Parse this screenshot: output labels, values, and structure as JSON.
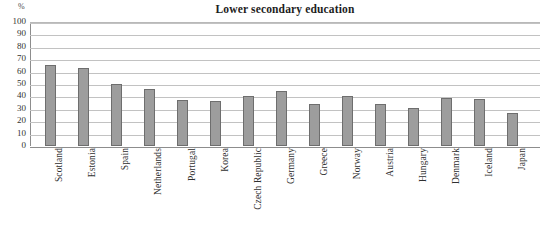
{
  "chart_data": {
    "type": "bar",
    "title": "Lower secondary education",
    "xlabel": "",
    "ylabel": "%",
    "unit": "%",
    "ylim": [
      0,
      100
    ],
    "ytick_step": 10,
    "yticks": [
      100,
      90,
      80,
      70,
      60,
      50,
      40,
      30,
      20,
      10,
      0
    ],
    "grid": true,
    "legend": "none",
    "bar_color": "#9d9d9d",
    "bar_border_color": "#6e6e6e",
    "gridline_color": "#c2c2c2",
    "axis_color": "#8d8d8d",
    "categories": [
      "Scotland",
      "Estonia",
      "Spain",
      "Netherlands",
      "Portugal",
      "Korea",
      "Czech Republic",
      "Germany",
      "Greece",
      "Norway",
      "Austria",
      "Hungary",
      "Denmark",
      "Iceland",
      "Japan"
    ],
    "values": [
      65,
      63,
      50,
      46,
      37,
      36,
      40,
      44,
      34,
      40,
      34,
      31,
      39,
      38,
      27
    ]
  }
}
